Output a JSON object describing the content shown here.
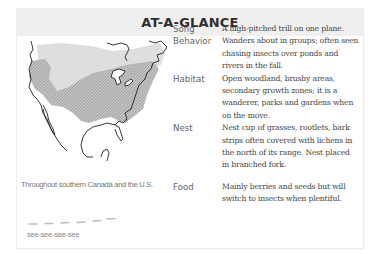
{
  "header": {
    "title": "AT-A-GLANCE"
  },
  "map": {
    "icon": "range-map-north-america",
    "caption": "Throughout southern Canada and the U.S.",
    "colors": {
      "light_range": "#dcdcdc",
      "hatched_range": "#a8a8a8",
      "coast": "#222222"
    }
  },
  "song": {
    "sonogram_icon": "sonogram-dashes",
    "text": "see-see-see-see"
  },
  "facts": [
    {
      "label": "Song",
      "value": "A high-pitched trill on one plane."
    },
    {
      "label": "Behavior",
      "value": "Wanders about in groups; often seen chasing insects over ponds and rivers in the fall."
    },
    {
      "label": "Habitat",
      "value": "Open woodland, brushy areas, secondary growth zones; it is a wanderer, parks and gardens when on the move."
    },
    {
      "label": "Nest",
      "value": "Nest cup of grasses, rootlets, bark strips often covered with lichens in the north of its range. Nest placed in branched fork."
    },
    {
      "label": "Food",
      "value": "Mainly berries and seeds but will switch to insects when plentiful."
    }
  ]
}
